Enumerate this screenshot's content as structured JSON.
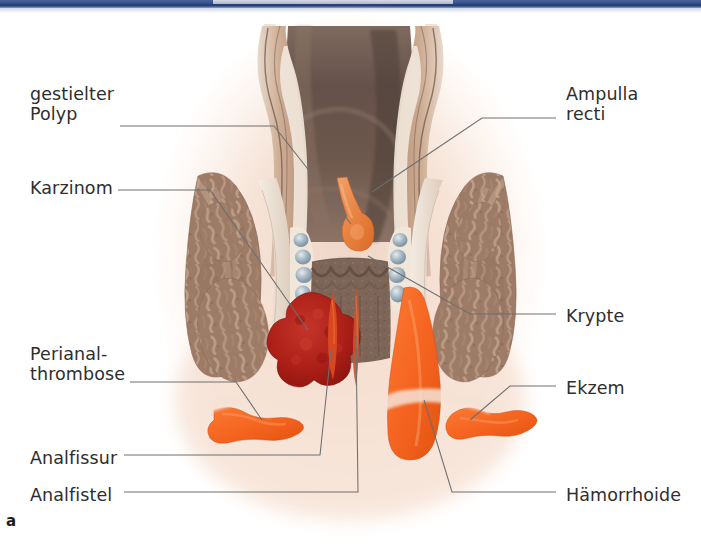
{
  "figure": {
    "caption": "a"
  },
  "topbar": {
    "bar_color": "#2f4c8a",
    "segment_color": "#c3cbdb"
  },
  "labels": {
    "left": [
      {
        "id": "gestielter-polyp",
        "text": "gestielter\nPolyp",
        "x": 30,
        "y": 84
      },
      {
        "id": "karzinom",
        "text": "Karzinom",
        "x": 30,
        "y": 178
      },
      {
        "id": "perianalthrombose",
        "text": "Perianal-\nthrombose",
        "x": 30,
        "y": 344
      },
      {
        "id": "analfissur",
        "text": "Analfissur",
        "x": 30,
        "y": 448
      },
      {
        "id": "analfistel",
        "text": "Analfistel",
        "x": 30,
        "y": 485
      }
    ],
    "right": [
      {
        "id": "ampulla-recti",
        "text": "Ampulla\nrecti",
        "x": 566,
        "y": 84
      },
      {
        "id": "krypte",
        "text": "Krypte",
        "x": 566,
        "y": 306
      },
      {
        "id": "ekzem",
        "text": "Ekzem",
        "x": 566,
        "y": 378
      },
      {
        "id": "haemorrhoide",
        "text": "Hämorrhoide",
        "x": 566,
        "y": 485
      }
    ]
  },
  "palette": {
    "lumen_dark": "#5d4a42",
    "lumen_mid": "#7a6357",
    "mucosa_light": "#ded2c6",
    "wall_tan": "#c49d84",
    "muscle_brown": "#9d7b67",
    "muscle_light": "#c9ab95",
    "skin_wash": "#f3ddd0",
    "carcinoma_red": "#b5281e",
    "lesion_orange": "#f4621f",
    "polyp_orange": "#e8813f",
    "vessel_blue": "#9fb2bd",
    "leader_gray": "#6e6e6e",
    "text_gray": "#2e2e2e"
  },
  "structures": [
    {
      "id": "ampulla-recti",
      "label": "Ampulla recti",
      "color": "#6b564b",
      "note": "rectal lumen, dark brown, upper centre"
    },
    {
      "id": "gestielter-polyp",
      "label": "gestielter Polyp",
      "color": "#e8813f",
      "note": "pedunculated polyp on rectal wall"
    },
    {
      "id": "karzinom",
      "label": "Karzinom",
      "color": "#b5281e",
      "note": "nodular dark red tumour, left wall"
    },
    {
      "id": "krypte",
      "label": "Krypte",
      "color": "#8a6e5e",
      "note": "anal crypts / columnae anales"
    },
    {
      "id": "haemorrhoide",
      "label": "Hämorrhoide",
      "color": "#f4621f",
      "note": "large orange haemorrhoid, right anal canal"
    },
    {
      "id": "perianalthrombose",
      "label": "Perianalthrombose",
      "color": "#f4621f",
      "note": "orange thrombosis, left perianal skin"
    },
    {
      "id": "ekzem",
      "label": "Ekzem",
      "color": "#f4621f",
      "note": "orange eczema patch, right perianal skin"
    },
    {
      "id": "analfissur",
      "label": "Analfissur",
      "color": "#d8481e",
      "note": "thin fissure in anal canal, left of midline"
    },
    {
      "id": "analfistel",
      "label": "Analfistel",
      "color": "#c8542c",
      "note": "fistula tract, midline anal canal"
    }
  ]
}
